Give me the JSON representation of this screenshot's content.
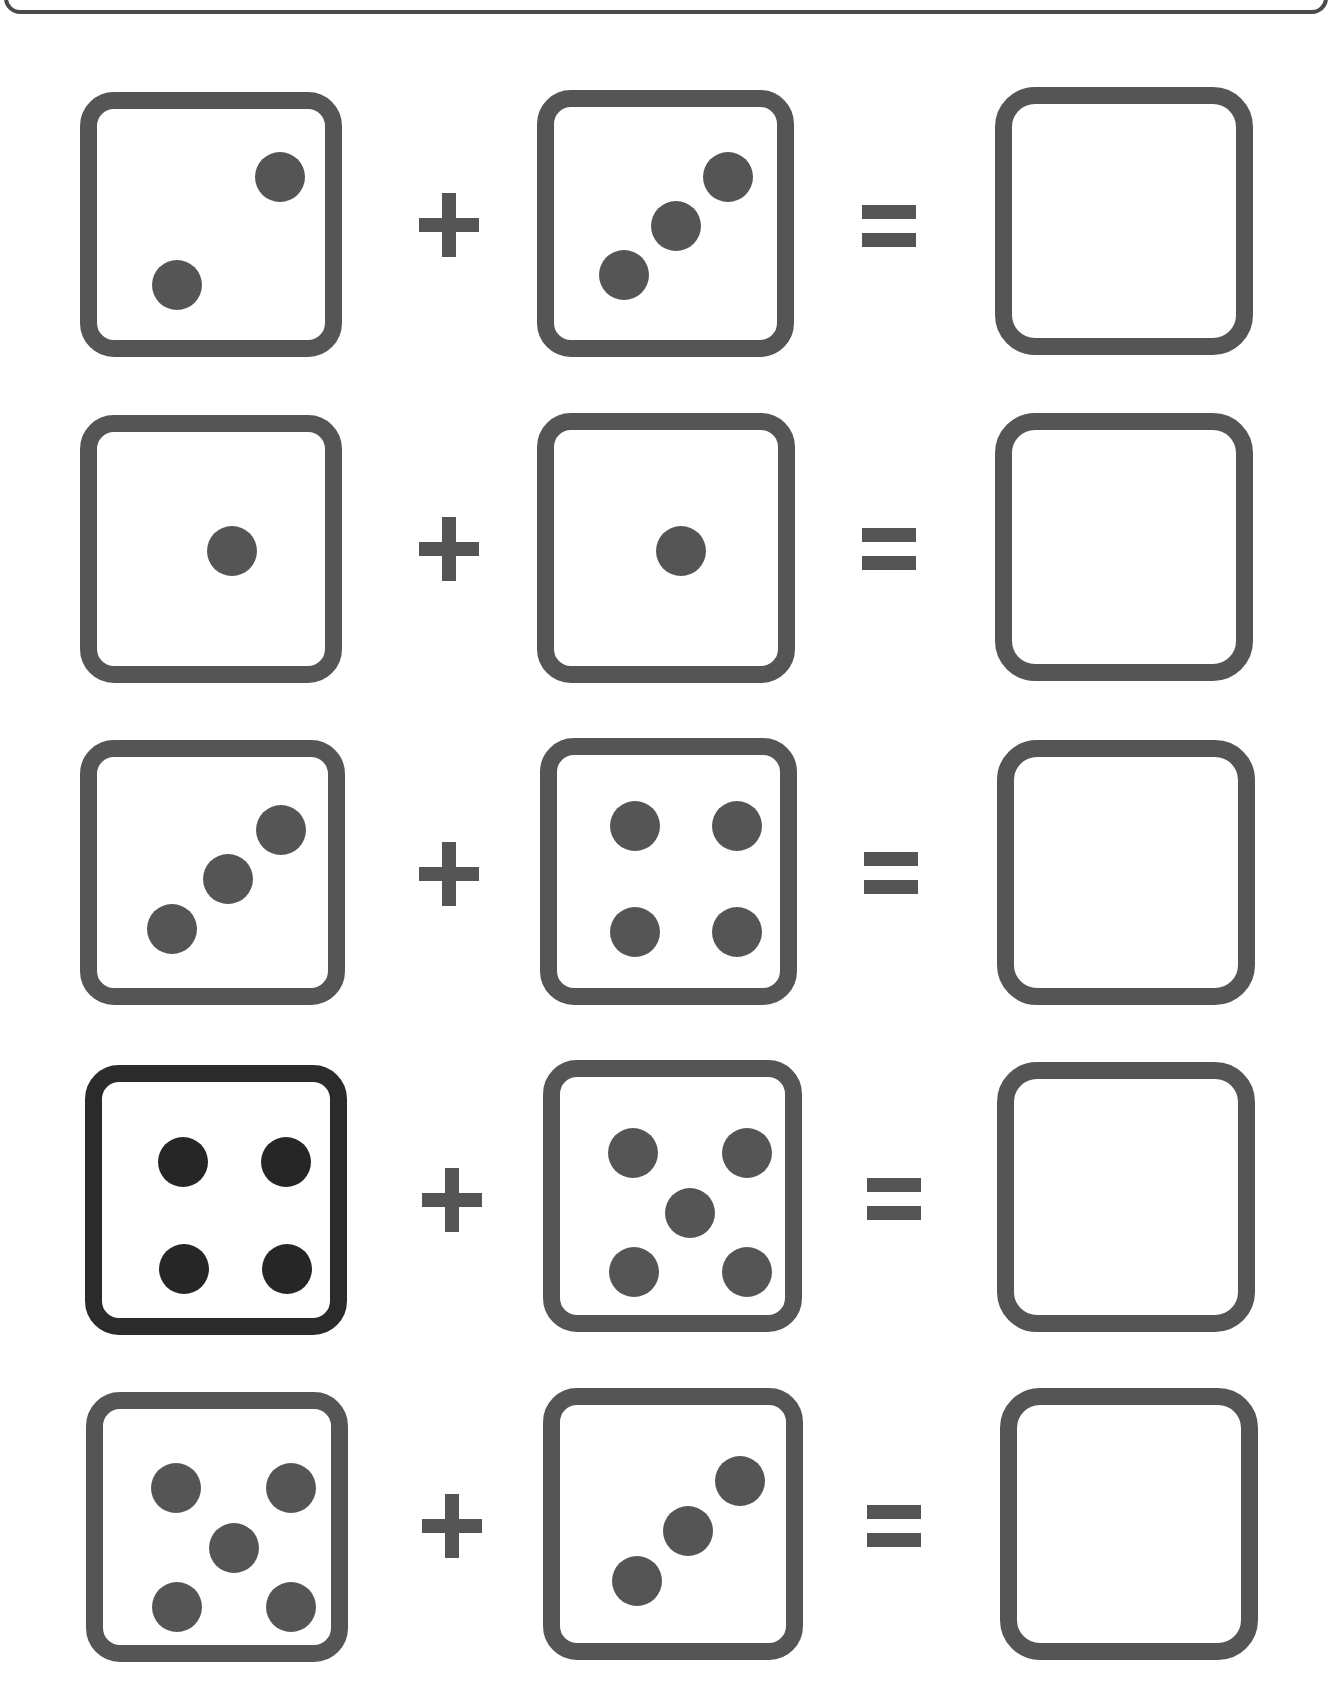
{
  "worksheet": {
    "type": "dice-addition",
    "operator_plus": "+",
    "operator_equals": "=",
    "colors": {
      "die_border": "#555555",
      "pip": "#555555",
      "dark_die_border": "#2b2b2b",
      "dark_pip": "#262626"
    },
    "problems": [
      {
        "left_die": 2,
        "right_die": 3,
        "answer": ""
      },
      {
        "left_die": 1,
        "right_die": 1,
        "answer": ""
      },
      {
        "left_die": 3,
        "right_die": 4,
        "answer": ""
      },
      {
        "left_die": 4,
        "right_die": 5,
        "answer": ""
      },
      {
        "left_die": 5,
        "right_die": 3,
        "answer": ""
      }
    ]
  }
}
